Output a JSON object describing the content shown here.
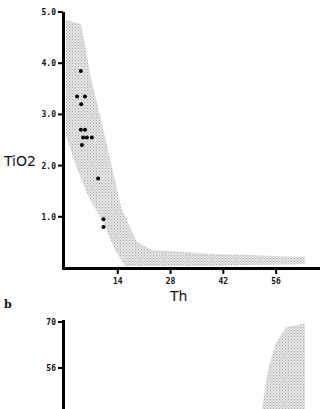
{
  "chart_data": [
    {
      "type": "scatter",
      "panel": "a",
      "title": "",
      "xlabel": "Th",
      "ylabel": "TiO2",
      "xlim": [
        0,
        68
      ],
      "ylim": [
        0,
        5.0
      ],
      "x_ticks": [
        "14",
        "28",
        "42",
        "56"
      ],
      "y_ticks": [
        "1.0",
        "2.0",
        "3.0",
        "4.0",
        "5.0"
      ],
      "grid": false,
      "legend": null,
      "shaded_field": {
        "description": "stippled grey envelope field",
        "upper_edge": [
          [
            0.5,
            4.8
          ],
          [
            4,
            4.7
          ],
          [
            7,
            3.7
          ],
          [
            11,
            2.5
          ],
          [
            15,
            1.2
          ],
          [
            19,
            0.5
          ],
          [
            23,
            0.35
          ],
          [
            40,
            0.28
          ],
          [
            60,
            0.22
          ]
        ],
        "lower_edge": [
          [
            0.5,
            2.6
          ],
          [
            3,
            2.0
          ],
          [
            6,
            1.4
          ],
          [
            9,
            0.9
          ],
          [
            12,
            0.4
          ],
          [
            15,
            0.05
          ],
          [
            30,
            0.05
          ],
          [
            60,
            0.12
          ]
        ]
      },
      "series": [
        {
          "name": "samples",
          "x": [
            4.2,
            3.2,
            5.3,
            4.3,
            4.2,
            5.3,
            4.8,
            5.8,
            7.1,
            4.5,
            8.8,
            10.2,
            10.2
          ],
          "y": [
            3.85,
            3.35,
            3.35,
            3.2,
            2.7,
            2.7,
            2.55,
            2.55,
            2.55,
            2.4,
            1.75,
            0.95,
            0.8
          ]
        }
      ]
    },
    {
      "type": "area",
      "panel": "b",
      "title": "",
      "xlabel": "",
      "ylabel": "",
      "y_ticks": [
        "56",
        "70"
      ],
      "grid": false,
      "note": "partially visible second panel; stippled field near right edge"
    }
  ],
  "panel_labels": {
    "b": "b"
  }
}
